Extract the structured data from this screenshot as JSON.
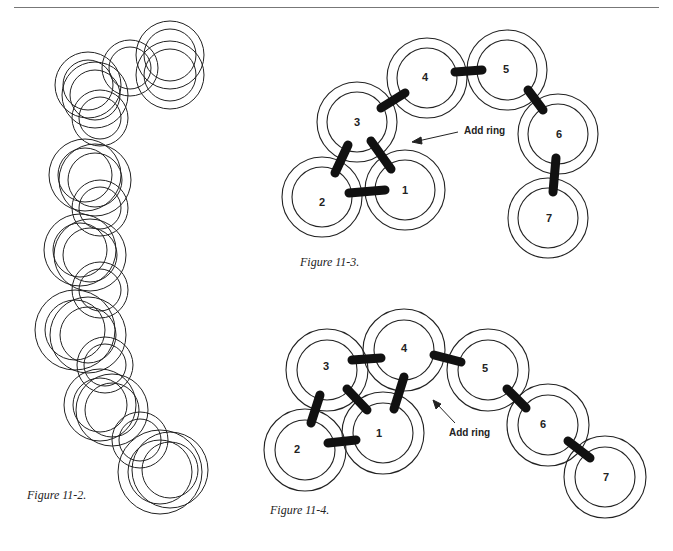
{
  "page": {
    "rule_color": "#777777"
  },
  "figures": [
    {
      "id": "fig-11-2",
      "caption": "Figure 11-2.",
      "description": "Chain of interlinked rings (Byzantine-style weave), drawn as overlapping double-outlined rings"
    },
    {
      "id": "fig-11-3",
      "caption": "Figure 11-3.",
      "annotation": "Add ring",
      "rings": [
        {
          "label": "1"
        },
        {
          "label": "2"
        },
        {
          "label": "3"
        },
        {
          "label": "4"
        },
        {
          "label": "5"
        },
        {
          "label": "6"
        },
        {
          "label": "7"
        }
      ]
    },
    {
      "id": "fig-11-4",
      "caption": "Figure 11-4.",
      "annotation": "Add ring",
      "rings": [
        {
          "label": "1"
        },
        {
          "label": "2"
        },
        {
          "label": "3"
        },
        {
          "label": "4"
        },
        {
          "label": "5"
        },
        {
          "label": "6"
        },
        {
          "label": "7"
        }
      ]
    }
  ]
}
